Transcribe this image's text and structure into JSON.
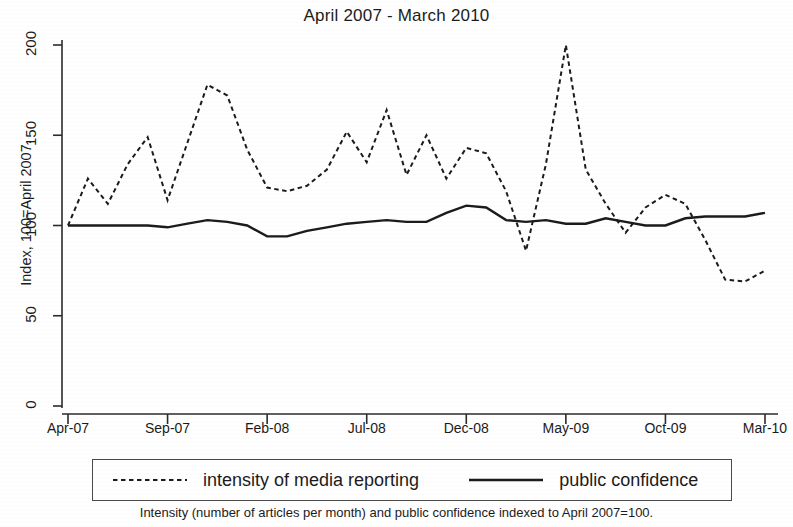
{
  "chart_data": {
    "type": "line",
    "title": "April 2007 - March 2010",
    "xlabel": "",
    "ylabel": "Index, 100=April 2007.",
    "footnote": "Intensity (number of articles per month) and public confidence indexed to April 2007=100.",
    "ylim": [
      0,
      200
    ],
    "yticks": [
      0,
      50,
      100,
      150,
      200
    ],
    "ytick_labels": [
      "0",
      "50",
      "100",
      "150",
      "200"
    ],
    "grid": false,
    "legend_position": "below-plot",
    "x": [
      "Apr-07",
      "May-07",
      "Jun-07",
      "Jul-07",
      "Aug-07",
      "Sep-07",
      "Oct-07",
      "Nov-07",
      "Dec-07",
      "Jan-08",
      "Feb-08",
      "Mar-08",
      "Apr-08",
      "May-08",
      "Jun-08",
      "Jul-08",
      "Aug-08",
      "Sep-08",
      "Oct-08",
      "Nov-08",
      "Dec-08",
      "Jan-09",
      "Feb-09",
      "Mar-09",
      "Apr-09",
      "May-09",
      "Jun-09",
      "Jul-09",
      "Aug-09",
      "Sep-09",
      "Oct-09",
      "Nov-09",
      "Dec-09",
      "Jan-10",
      "Feb-10",
      "Mar-10"
    ],
    "xtick_labels": [
      "Apr-07",
      "Sep-07",
      "Feb-08",
      "Jul-08",
      "Dec-08",
      "May-09",
      "Oct-09",
      "Mar-10"
    ],
    "xtick_indices": [
      0,
      5,
      10,
      15,
      20,
      25,
      30,
      35
    ],
    "series": [
      {
        "name": "intensity of media reporting",
        "style": "dashed",
        "color": "#1b1b1b",
        "values": [
          100,
          126,
          112,
          134,
          149,
          114,
          146,
          178,
          172,
          142,
          121,
          119,
          122,
          131,
          152,
          135,
          164,
          128,
          150,
          126,
          143,
          140,
          119,
          86,
          134,
          200,
          131,
          112,
          96,
          110,
          117,
          112,
          92,
          70,
          69,
          75
        ]
      },
      {
        "name": "public confidence",
        "style": "solid",
        "color": "#1b1b1b",
        "values": [
          100,
          100,
          100,
          100,
          100,
          99,
          101,
          103,
          102,
          100,
          94,
          94,
          97,
          99,
          101,
          102,
          103,
          102,
          102,
          107,
          111,
          110,
          103,
          102,
          103,
          101,
          101,
          104,
          102,
          100,
          100,
          104,
          105,
          105,
          105,
          107
        ]
      }
    ]
  },
  "legend": {
    "entries": [
      {
        "label": "intensity of media reporting",
        "style": "dashed"
      },
      {
        "label": "public confidence",
        "style": "solid"
      }
    ]
  }
}
